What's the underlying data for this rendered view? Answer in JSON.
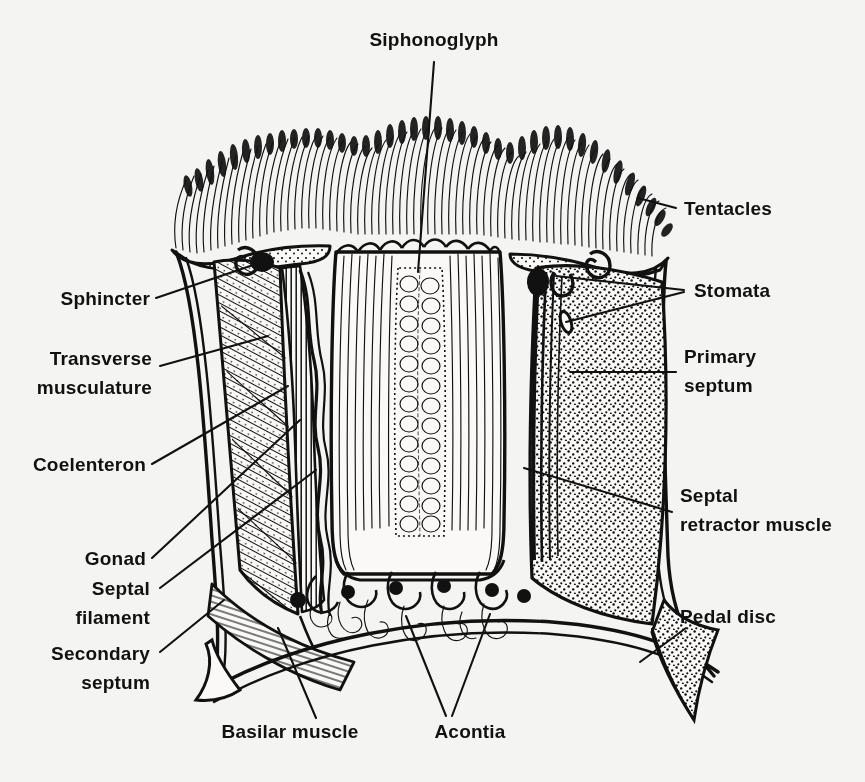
{
  "figure": {
    "background_color": "#f4f4f2",
    "ink_color": "#111111",
    "style": "black-and-white line drawing, scanned halftone"
  },
  "labels": {
    "siphonoglyph": "Siphonoglyph",
    "tentacles": "Tentacles",
    "stomata": "Stomata",
    "primary_septum_l1": "Primary",
    "primary_septum_l2": "septum",
    "septal_retractor_l1": "Septal",
    "septal_retractor_l2": "retractor muscle",
    "pedal_disc": "Pedal  disc",
    "sphincter": "Sphincter",
    "transverse_l1": "Transverse",
    "transverse_l2": "musculature",
    "coelenteron": "Coelenteron",
    "gonad": "Gonad",
    "septal_filament_l1": "Septal",
    "septal_filament_l2": "filament",
    "secondary_septum_l1": "Secondary",
    "secondary_septum_l2": "septum",
    "basilar_muscle": "Basilar muscle",
    "acontia": "Acontia"
  },
  "anatomy_parts": [
    {
      "name": "Siphonoglyph",
      "side": "top",
      "description": "ciliated groove in pharynx"
    },
    {
      "name": "Tentacles",
      "side": "right",
      "description": "crown of tentacles on oral disc"
    },
    {
      "name": "Stomata",
      "side": "right",
      "description": "openings in septum, two leader lines"
    },
    {
      "name": "Primary septum",
      "side": "right",
      "description": "complete mesentery, stippled"
    },
    {
      "name": "Septal retractor muscle",
      "side": "right",
      "description": "longitudinal muscle band on septum"
    },
    {
      "name": "Pedal disc",
      "side": "right",
      "description": "basal attachment disc"
    },
    {
      "name": "Sphincter",
      "side": "left",
      "description": "marginal sphincter muscle"
    },
    {
      "name": "Transverse musculature",
      "side": "left",
      "description": "hatched band"
    },
    {
      "name": "Coelenteron",
      "side": "left",
      "description": "gastrovascular cavity"
    },
    {
      "name": "Gonad",
      "side": "left",
      "description": "wavy gonadal band on septum"
    },
    {
      "name": "Septal filament",
      "side": "left",
      "description": "free margin of septum"
    },
    {
      "name": "Secondary septum",
      "side": "left",
      "description": "incomplete mesentery"
    },
    {
      "name": "Basilar muscle",
      "side": "bottom",
      "description": "hatched muscle at base"
    },
    {
      "name": "Acontia",
      "side": "bottom",
      "description": "coiled nematocyst threads, two leader lines"
    }
  ]
}
